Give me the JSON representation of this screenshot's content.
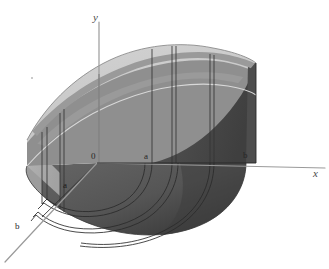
{
  "figure": {
    "background_color": "#ffffff"
  },
  "axes": {
    "x": {
      "label": "x",
      "label_x": 314,
      "label_y": 173,
      "line_color": "#9a9a9a"
    },
    "y": {
      "label": "y",
      "label_x": 93,
      "label_y": 16,
      "line_color": "#9a9a9a"
    },
    "z": {
      "label": "b",
      "label_x": 16,
      "label_y": 228,
      "line_color": "#9a9a9a"
    }
  },
  "tick_labels": [
    {
      "name": "origin",
      "text": "0",
      "x": 91,
      "y": 156,
      "on_dark": false
    },
    {
      "name": "x-inner-radius",
      "text": "a",
      "x": 144,
      "y": 156,
      "on_dark": false
    },
    {
      "name": "x-outer-radius",
      "text": "b",
      "x": 243,
      "y": 155,
      "on_dark": false
    },
    {
      "name": "z-inner-radius",
      "text": "a",
      "x": 63,
      "y": 185,
      "on_dark": true
    }
  ],
  "surface_colors": {
    "top_light": "#c9c9c9",
    "top_band": "#9b9b9b",
    "left_face": "#a9a9a9",
    "front_face": "#8e8e8e",
    "right_dark_face": "#4a4a4a",
    "base_dark": "#585858",
    "base_darker": "#3d3d3d",
    "outline": "#2b2b2b",
    "grid_line": "#3a3a3a"
  },
  "geometry": {
    "inner_radius_label": "a",
    "outer_radius_label": "b",
    "origin_px": {
      "x": 97,
      "y": 163
    },
    "x_axis_end_px": {
      "x": 325,
      "y": 171
    },
    "y_axis_top_px": {
      "x": 99,
      "y": 22
    },
    "z_axis_end_px": {
      "x": 5,
      "y": 262
    }
  },
  "decorations": {
    "speck": {
      "x": 31,
      "y": 77
    }
  }
}
